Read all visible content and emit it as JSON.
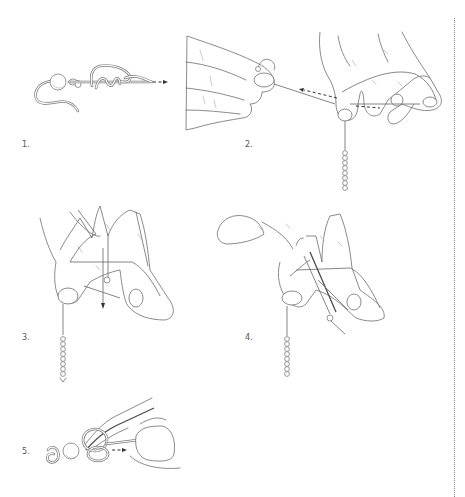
{
  "figure": {
    "steps": [
      {
        "number": "1.",
        "icon": "knot-with-bead-icon"
      },
      {
        "number": "2.",
        "icon": "hands-holding-line-icon"
      },
      {
        "number": "3.",
        "icon": "hands-threading-line-icon"
      },
      {
        "number": "4.",
        "icon": "hands-pulling-loop-icon"
      },
      {
        "number": "5.",
        "icon": "tweezers-tightening-knot-icon"
      }
    ]
  },
  "colors": {
    "ink": "#6d6d6d",
    "arrow": "#333333",
    "background": "#ffffff",
    "divider": "#888888"
  }
}
